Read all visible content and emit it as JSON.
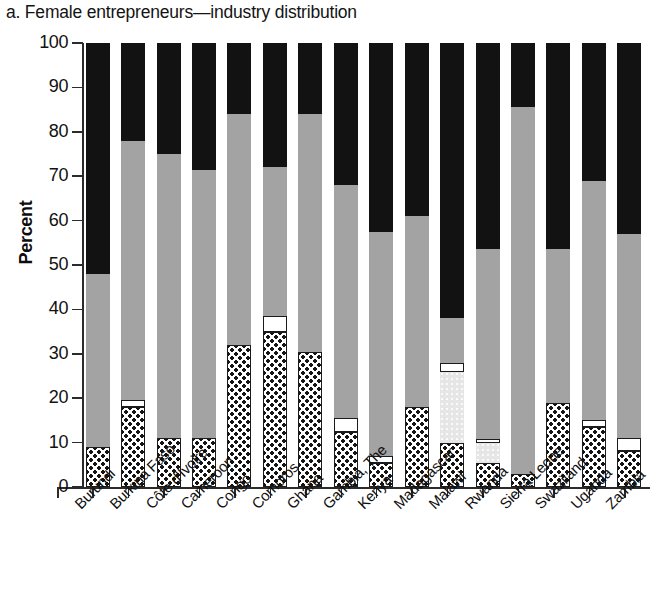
{
  "chart_data": {
    "type": "bar",
    "title": "a. Female entrepreneurs—industry distribution",
    "subtitle": "",
    "xlabel": "",
    "ylabel": "Percent",
    "stacked": true,
    "normalized_to": 100,
    "ylim": [
      0,
      100
    ],
    "ytick_labels": [
      "100",
      "90",
      "80",
      "70",
      "60",
      "50",
      "40",
      "30",
      "20",
      "10",
      "0"
    ],
    "ytick_values": [
      100,
      90,
      80,
      70,
      60,
      50,
      40,
      30,
      20,
      10,
      0
    ],
    "grid": false,
    "legend_position": "none",
    "categories": [
      "Burundi",
      "Burkina Faso",
      "Côte d'Ivoire",
      "Cameroon",
      "Congo",
      "Comoros",
      "Ghana",
      "Gambia, The",
      "Kenya",
      "Madagascar",
      "Malawi",
      "Rwanda",
      "Sierra Leone",
      "Swaziland",
      "Uganda",
      "Zambia"
    ],
    "series": [
      {
        "name": "segment-dotted",
        "pattern": "checkered",
        "color": "#ffffff",
        "values": [
          9.0,
          18.0,
          11.0,
          11.0,
          32.0,
          35.0,
          30.5,
          12.5,
          5.5,
          18.0,
          10.0,
          5.5,
          3.0,
          19.0,
          13.5,
          8.0
        ]
      },
      {
        "name": "segment-pale",
        "pattern": "light-stipple",
        "color": "#e6e6e6",
        "values": [
          0,
          0,
          0,
          0,
          0,
          0,
          0,
          0,
          0,
          0,
          16.0,
          4.5,
          0,
          0,
          0,
          0
        ]
      },
      {
        "name": "segment-white",
        "pattern": "outlined-white",
        "color": "#ffffff",
        "values": [
          0,
          1.5,
          0,
          0,
          0,
          3.5,
          0,
          3.0,
          1.5,
          0,
          2.0,
          0.8,
          0,
          0,
          1.5,
          3.0
        ]
      },
      {
        "name": "segment-gray",
        "pattern": "stipple",
        "color": "#a3a3a3",
        "values": [
          39.0,
          58.5,
          64.0,
          60.5,
          52.0,
          33.5,
          53.5,
          52.5,
          50.5,
          43.0,
          10.0,
          42.7,
          82.5,
          34.5,
          54.0,
          46.0
        ]
      },
      {
        "name": "segment-black",
        "pattern": "solid",
        "color": "#121212",
        "values": [
          52.0,
          22.0,
          25.0,
          28.5,
          16.0,
          28.0,
          16.0,
          32.0,
          42.5,
          39.0,
          62.0,
          46.5,
          14.5,
          46.5,
          31.0,
          43.0
        ]
      }
    ],
    "cumulative_tops": {
      "Burundi": {
        "dotted": 9.0,
        "pale": 9.0,
        "white": 9.0,
        "gray": 48.0,
        "black": 100
      },
      "Burkina Faso": {
        "dotted": 18.0,
        "pale": 18.0,
        "white": 19.5,
        "gray": 78.0,
        "black": 100
      },
      "Côte d'Ivoire": {
        "dotted": 11.0,
        "pale": 11.0,
        "white": 11.0,
        "gray": 75.0,
        "black": 100
      },
      "Cameroon": {
        "dotted": 11.0,
        "pale": 11.0,
        "white": 11.0,
        "gray": 71.5,
        "black": 100
      },
      "Congo": {
        "dotted": 32.0,
        "pale": 32.0,
        "white": 32.0,
        "gray": 84.0,
        "black": 100
      },
      "Comoros": {
        "dotted": 35.0,
        "pale": 35.0,
        "white": 38.5,
        "gray": 72.0,
        "black": 100
      },
      "Ghana": {
        "dotted": 30.5,
        "pale": 30.5,
        "white": 30.5,
        "gray": 84.0,
        "black": 100
      },
      "Gambia, The": {
        "dotted": 12.5,
        "pale": 12.5,
        "white": 15.5,
        "gray": 68.0,
        "black": 100
      },
      "Kenya": {
        "dotted": 5.5,
        "pale": 5.5,
        "white": 7.0,
        "gray": 57.5,
        "black": 100
      },
      "Madagascar": {
        "dotted": 18.0,
        "pale": 18.0,
        "white": 18.0,
        "gray": 61.0,
        "black": 100
      },
      "Malawi": {
        "dotted": 10.0,
        "pale": 26.0,
        "white": 28.0,
        "gray": 38.0,
        "black": 100
      },
      "Rwanda": {
        "dotted": 5.5,
        "pale": 10.0,
        "white": 10.8,
        "gray": 53.5,
        "black": 100
      },
      "Sierra Leone": {
        "dotted": 3.0,
        "pale": 3.0,
        "white": 3.0,
        "gray": 85.5,
        "black": 100
      },
      "Swaziland": {
        "dotted": 19.0,
        "pale": 19.0,
        "white": 19.0,
        "gray": 53.5,
        "black": 100
      },
      "Uganda": {
        "dotted": 13.5,
        "pale": 13.5,
        "white": 15.0,
        "gray": 69.0,
        "black": 100
      },
      "Zambia": {
        "dotted": 8.0,
        "pale": 8.0,
        "white": 11.0,
        "gray": 57.0,
        "black": 100
      }
    }
  },
  "colors": {
    "black": "#121212",
    "gray": "#a3a3a3",
    "pale": "#e6e6e6",
    "white": "#ffffff",
    "axis": "#2b2b2b",
    "text": "#111111"
  }
}
